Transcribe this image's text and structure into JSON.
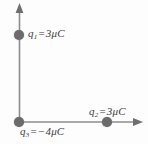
{
  "figure": {
    "background_color": "#fdfdfd",
    "axis_color": "#8c8c8c",
    "charge_color": "#6b6b6b",
    "label_color": "#3c3c3c"
  },
  "axes": {
    "vertical": {
      "name": "y-axis",
      "arrow": "up"
    },
    "horizontal": {
      "name": "x-axis",
      "arrow": "right"
    }
  },
  "charges": [
    {
      "id": "q1",
      "symbol": "q",
      "subscript": "1",
      "equals": "=",
      "value": "3",
      "unit": "μC",
      "full_label": "q₁ = 3μC",
      "position": "on vertical axis above origin"
    },
    {
      "id": "q2",
      "symbol": "q",
      "subscript": "2",
      "equals": "=",
      "value": "3",
      "unit": "μC",
      "full_label": "q₂ = 3μC",
      "position": "on horizontal axis right of origin"
    },
    {
      "id": "q3",
      "symbol": "q",
      "subscript": "3",
      "equals": "=",
      "value": "−4",
      "unit": "μC",
      "full_label": "q₃ = −4μC",
      "position": "at origin"
    }
  ]
}
